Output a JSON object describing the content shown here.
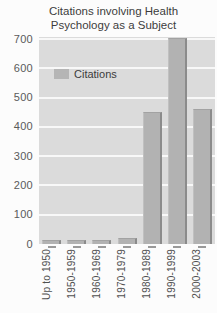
{
  "title": {
    "line1": "Citations involving Health",
    "line2": "Psychology as a Subject"
  },
  "legend": {
    "label": "Citations",
    "swatch_color": "#b5b5b5"
  },
  "chart_data": {
    "type": "bar",
    "title": "Citations involving Health Psychology as a Subject",
    "series_name": "Citations",
    "categories": [
      "Up to 1950",
      "1950-1959",
      "1960-1969",
      "1970-1979",
      "1980-1989",
      "1990-1999",
      "2000-2003"
    ],
    "values": [
      15,
      15,
      15,
      20,
      450,
      705,
      460
    ],
    "xlabel": "",
    "ylabel": "",
    "ylim": [
      0,
      700
    ],
    "yticks": [
      0,
      100,
      200,
      300,
      400,
      500,
      600,
      700
    ],
    "grid": true,
    "gridline_color": "#f8f8f8",
    "plot_background": "#dbdbdb",
    "bar_fill": "#b2b2b2",
    "bar_edge": "#8b8b8b",
    "legend_position": "upper-left-inside",
    "x_tick_label_rotation": 90
  }
}
